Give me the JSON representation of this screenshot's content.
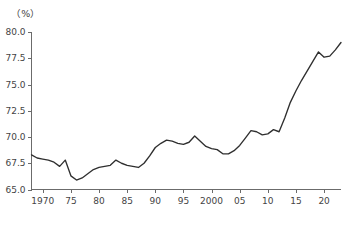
{
  "chart_data": {
    "type": "line",
    "title": "",
    "subtitle": "",
    "xlabel": "",
    "ylabel": "",
    "unit_label": "（%）",
    "ylim": [
      65.0,
      80.0
    ],
    "xlim": [
      1968,
      2023
    ],
    "grid": false,
    "legend": "none",
    "y_ticks": [
      65.0,
      67.5,
      70.0,
      72.5,
      75.0,
      77.5,
      80.0
    ],
    "y_tick_labels": [
      "65.0",
      "67.5",
      "70.0",
      "72.5",
      "75.0",
      "77.5",
      "80.0"
    ],
    "x_ticks": [
      1970,
      1975,
      1980,
      1985,
      1990,
      1995,
      2000,
      2005,
      2010,
      2015,
      2020
    ],
    "x_tick_labels": [
      "1970",
      "75",
      "80",
      "85",
      "90",
      "95",
      "2000",
      "05",
      "10",
      "15",
      "20"
    ],
    "line_color": "#2f2f2f",
    "axis_color": "#6b6b6b",
    "background_color": "#ffffff",
    "x": [
      1968,
      1969,
      1970,
      1971,
      1972,
      1973,
      1974,
      1975,
      1976,
      1977,
      1978,
      1979,
      1980,
      1981,
      1982,
      1983,
      1984,
      1985,
      1986,
      1987,
      1988,
      1989,
      1990,
      1991,
      1992,
      1993,
      1994,
      1995,
      1996,
      1997,
      1998,
      1999,
      2000,
      2001,
      2002,
      2003,
      2004,
      2005,
      2006,
      2007,
      2008,
      2009,
      2010,
      2011,
      2012,
      2013,
      2014,
      2015,
      2016,
      2017,
      2018,
      2019,
      2020,
      2021,
      2022,
      2023
    ],
    "values": [
      68.3,
      68.0,
      67.9,
      67.8,
      67.6,
      67.2,
      67.8,
      66.3,
      65.9,
      66.1,
      66.5,
      66.9,
      67.1,
      67.2,
      67.3,
      67.8,
      67.5,
      67.3,
      67.2,
      67.1,
      67.5,
      68.2,
      69.0,
      69.4,
      69.7,
      69.6,
      69.4,
      69.3,
      69.5,
      70.1,
      69.6,
      69.1,
      68.9,
      68.8,
      68.4,
      68.4,
      68.7,
      69.2,
      69.9,
      70.6,
      70.5,
      70.2,
      70.3,
      70.7,
      70.5,
      71.8,
      73.3,
      74.4,
      75.4,
      76.3,
      77.2,
      78.1,
      77.6,
      77.7,
      78.3,
      79.0
    ],
    "series": [
      {
        "name": "rate",
        "values": [
          68.3,
          68.0,
          67.9,
          67.8,
          67.6,
          67.2,
          67.8,
          66.3,
          65.9,
          66.1,
          66.5,
          66.9,
          67.1,
          67.2,
          67.3,
          67.8,
          67.5,
          67.3,
          67.2,
          67.1,
          67.5,
          68.2,
          69.0,
          69.4,
          69.7,
          69.6,
          69.4,
          69.3,
          69.5,
          70.1,
          69.6,
          69.1,
          68.9,
          68.8,
          68.4,
          68.4,
          68.7,
          69.2,
          69.9,
          70.6,
          70.5,
          70.2,
          70.3,
          70.7,
          70.5,
          71.8,
          73.3,
          74.4,
          75.4,
          76.3,
          77.2,
          78.1,
          77.6,
          77.7,
          78.3,
          79.0
        ]
      }
    ],
    "annotations": []
  }
}
